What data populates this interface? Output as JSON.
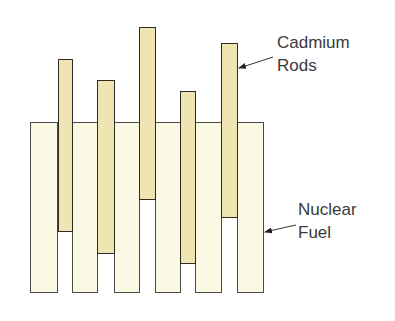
{
  "diagram": {
    "title": "",
    "colors": {
      "fuel_fill": "#fbf8e3",
      "cadmium_fill": "#f1e4b3",
      "outline": "#3a3a3a",
      "text": "#3a3a3a"
    },
    "fuel_rods": [
      {
        "x": 30,
        "y": 122,
        "w": 28,
        "h": 171
      },
      {
        "x": 72,
        "y": 122,
        "w": 26,
        "h": 171
      },
      {
        "x": 114,
        "y": 122,
        "w": 26,
        "h": 171
      },
      {
        "x": 155,
        "y": 122,
        "w": 26,
        "h": 171
      },
      {
        "x": 195,
        "y": 122,
        "w": 27,
        "h": 171
      },
      {
        "x": 237,
        "y": 122,
        "w": 27,
        "h": 171
      }
    ],
    "cadmium_rods": [
      {
        "x": 58,
        "y": 59,
        "w": 15,
        "h": 173
      },
      {
        "x": 97,
        "y": 80,
        "w": 18,
        "h": 174
      },
      {
        "x": 139,
        "y": 27,
        "w": 17,
        "h": 173
      },
      {
        "x": 180,
        "y": 91,
        "w": 16,
        "h": 173
      },
      {
        "x": 221,
        "y": 43,
        "w": 17,
        "h": 175
      }
    ],
    "labels": {
      "cadmium": {
        "line1": "Cadmium",
        "line2": "Rods"
      },
      "fuel": {
        "line1": "Nuclear",
        "line2": "Fuel"
      }
    }
  }
}
